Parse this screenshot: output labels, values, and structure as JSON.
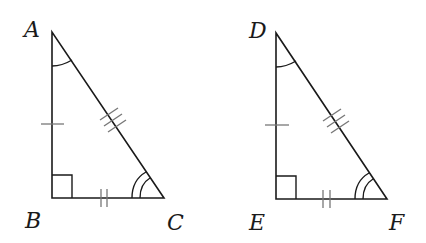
{
  "diagram": {
    "colors": {
      "line": "#1a1a1a",
      "tick": "#777777",
      "background": "#ffffff"
    },
    "triangles": [
      {
        "name": "ABC",
        "vertices": [
          {
            "label": "A",
            "x": 52,
            "y": 32
          },
          {
            "label": "B",
            "x": 52,
            "y": 198
          },
          {
            "label": "C",
            "x": 164,
            "y": 198
          }
        ],
        "right_angle_at": "B",
        "side_marks": {
          "AB": 1,
          "BC": 2,
          "AC": 3
        },
        "angle_marks": {
          "A": 1,
          "C": 2
        }
      },
      {
        "name": "DEF",
        "vertices": [
          {
            "label": "D",
            "x": 276,
            "y": 33
          },
          {
            "label": "E",
            "x": 276,
            "y": 199
          },
          {
            "label": "F",
            "x": 387,
            "y": 199
          }
        ],
        "right_angle_at": "E",
        "side_marks": {
          "DE": 1,
          "EF": 2,
          "DF": 3
        },
        "angle_marks": {
          "D": 1,
          "F": 2
        }
      }
    ],
    "labels": {
      "A": "A",
      "B": "B",
      "C": "C",
      "D": "D",
      "E": "E",
      "F": "F"
    }
  }
}
